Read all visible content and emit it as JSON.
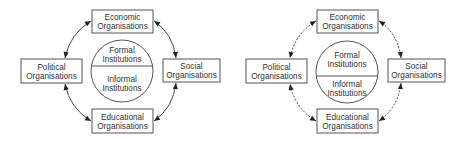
{
  "diagrams": [
    {
      "id": "left",
      "style": "solid",
      "nodes": {
        "top": [
          "Economic",
          "Organisations"
        ],
        "left": [
          "Political",
          "Organisations"
        ],
        "right": [
          "Social",
          "Organisations"
        ],
        "bottom": [
          "Educational",
          "Organisations"
        ]
      },
      "center": {
        "upper": [
          "Formal",
          "Institutions"
        ],
        "lower": [
          "Informal",
          "Institutions"
        ]
      },
      "connections": [
        {
          "from": "top",
          "to": "left",
          "arrows": "both"
        },
        {
          "from": "top",
          "to": "right",
          "arrows": "both"
        },
        {
          "from": "bottom",
          "to": "left",
          "arrows": "both"
        },
        {
          "from": "bottom",
          "to": "right",
          "arrows": "both"
        }
      ]
    },
    {
      "id": "right",
      "style": "dashed",
      "nodes": {
        "top": [
          "Economic",
          "Organisations"
        ],
        "left": [
          "Political",
          "Organisations"
        ],
        "right": [
          "Social",
          "Organisations"
        ],
        "bottom": [
          "Educational",
          "Organisations"
        ]
      },
      "center": {
        "upper": [
          "Formal",
          "Institutions"
        ],
        "lower": [
          "Informal",
          "Institutions"
        ]
      },
      "connections": [
        {
          "from": "top",
          "to": "left",
          "arrows": "both"
        },
        {
          "from": "top",
          "to": "right",
          "arrows": "both"
        },
        {
          "from": "bottom",
          "to": "left",
          "arrows": "both"
        },
        {
          "from": "bottom",
          "to": "right",
          "arrows": "both"
        }
      ]
    }
  ]
}
